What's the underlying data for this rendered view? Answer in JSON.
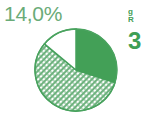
{
  "figure": {
    "background_color": "#ffffff",
    "width": 142,
    "height": 125
  },
  "label": {
    "value": "14,0%",
    "color": "#6aab78"
  },
  "edge_fragments": {
    "line1": "g",
    "line2": "R",
    "line3": "3",
    "color": "#3f9e55"
  },
  "chart_data": {
    "type": "pie",
    "title": "",
    "subtitle": "",
    "xlabel": "",
    "ylabel": "",
    "legend_position": "none",
    "grid": false,
    "start_angle_deg": 0,
    "direction": "clockwise",
    "center": {
      "x": 76,
      "y": 70
    },
    "radius": 41,
    "categories": [
      "Solid green segment",
      "Hatched segment",
      "White segment"
    ],
    "values": [
      30.0,
      56.0,
      14.0
    ],
    "units": "%",
    "annotations": [
      {
        "text": "14,0%",
        "target_category": "White segment",
        "x": 4,
        "y": 2
      }
    ],
    "slices": [
      {
        "label": "Solid green segment",
        "value": 30.0,
        "fill": "solid",
        "color": "#3f9e55",
        "start_deg": 0,
        "end_deg": 108
      },
      {
        "label": "Hatched segment",
        "value": 56.0,
        "fill": "crosshatch",
        "color": "#5fae70",
        "pattern_background": "#ffffff",
        "start_deg": 108,
        "end_deg": 309.6
      },
      {
        "label": "White segment",
        "value": 14.0,
        "fill": "solid",
        "color": "#ffffff",
        "stroke": "#3f9e55",
        "start_deg": 309.6,
        "end_deg": 360
      }
    ],
    "outline_color": "#3f9e55",
    "outline_width": 1.4
  }
}
